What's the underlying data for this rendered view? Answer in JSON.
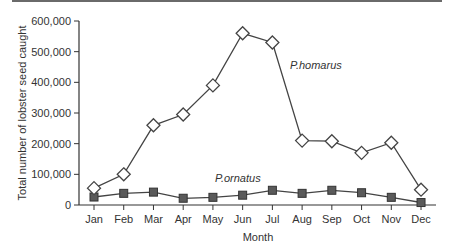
{
  "chart_data": {
    "type": "line",
    "title": "",
    "xlabel": "Month",
    "ylabel": "Total number of lobster seed caught",
    "ylim": [
      0,
      600000
    ],
    "yticks": [
      0,
      100000,
      200000,
      300000,
      400000,
      500000,
      600000
    ],
    "ytick_labels": [
      "0",
      "100,000",
      "200,000",
      "300,000",
      "400,000",
      "500,000",
      "600,000"
    ],
    "categories": [
      "Jan",
      "Feb",
      "Mar",
      "Apr",
      "May",
      "Jun",
      "Jul",
      "Aug",
      "Sep",
      "Oct",
      "Nov",
      "Dec"
    ],
    "grid": false,
    "legend": "none (inline series labels)",
    "series": [
      {
        "name": "P.homarus",
        "marker": "open-diamond",
        "values": [
          55000,
          100000,
          260000,
          295000,
          390000,
          560000,
          530000,
          210000,
          208000,
          170000,
          203000,
          50000
        ]
      },
      {
        "name": "P.ornatus",
        "marker": "filled-square",
        "values": [
          26000,
          38000,
          42000,
          22000,
          25000,
          32000,
          48000,
          38000,
          48000,
          40000,
          25000,
          8000
        ]
      }
    ],
    "annotations": [
      {
        "text": "P.homarus",
        "near": "Jul-Aug"
      },
      {
        "text": "P.ornatus",
        "near": "May-Jun"
      }
    ]
  },
  "colors": {
    "line": "#444444",
    "square_fill": "#5a5a5a",
    "square_stroke": "#333333",
    "diamond_fill": "#ffffff",
    "axis": "#333333"
  }
}
